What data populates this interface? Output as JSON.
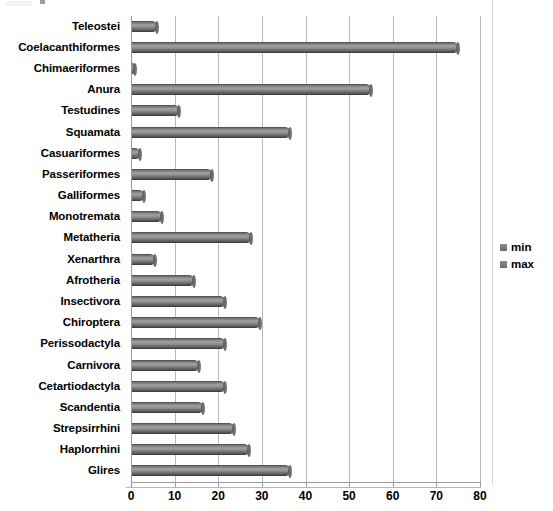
{
  "chart_data": {
    "type": "bar",
    "orientation": "horizontal",
    "title": "",
    "xlabel": "",
    "ylabel": "",
    "xlim": [
      0,
      80
    ],
    "xticks": [
      0,
      10,
      20,
      30,
      40,
      50,
      60,
      70,
      80
    ],
    "grid": true,
    "legend_position": "right",
    "legend": [
      "min",
      "max"
    ],
    "categories": [
      "Teleostei",
      "Coelacanthiformes",
      "Chimaeriformes",
      "Anura",
      "Testudines",
      "Squamata",
      "Casuariformes",
      "Passeriformes",
      "Galliformes",
      "Monotremata",
      "Metatheria",
      "Xenarthra",
      "Afrotheria",
      "Insectivora",
      "Chiroptera",
      "Perissodactyla",
      "Carnivora",
      "Cetartiodactyla",
      "Scandentia",
      "Strepsirrhini",
      "Haplorrhini",
      "Glires"
    ],
    "series": [
      {
        "name": "max",
        "values": [
          6,
          75,
          1,
          55,
          11,
          36.5,
          2,
          18.5,
          3,
          7,
          27.5,
          5.5,
          14.5,
          21.5,
          29.5,
          21.5,
          15.5,
          21.5,
          16.5,
          23.5,
          27,
          36.5
        ]
      },
      {
        "name": "min",
        "values": [
          0,
          0,
          0,
          0,
          0,
          0,
          0,
          0,
          0,
          0,
          0,
          0,
          0,
          0,
          0,
          0,
          0,
          0,
          0,
          0,
          0,
          0
        ]
      }
    ],
    "colors": {
      "bar": "#7d7d7d",
      "bar_edge": "#4f4f4f",
      "gridline": "#b9b9b9",
      "axis": "#9a9a9a",
      "text": "#000000"
    }
  },
  "legend": {
    "items": [
      {
        "label": "min",
        "swatch_icon": "square-swatch-icon"
      },
      {
        "label": "max",
        "swatch_icon": "square-swatch-icon"
      }
    ]
  }
}
